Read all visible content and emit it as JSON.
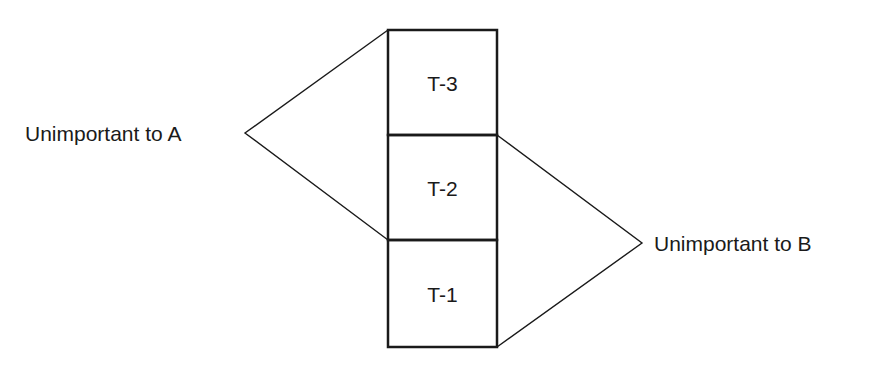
{
  "diagram": {
    "blocks": [
      {
        "id": "T-3",
        "label": "T-3"
      },
      {
        "id": "T-2",
        "label": "T-2"
      },
      {
        "id": "T-1",
        "label": "T-1"
      }
    ],
    "annotations": [
      {
        "label": "Unimportant to A",
        "spans": [
          "T-3",
          "T-2"
        ],
        "side": "left"
      },
      {
        "label": "Unimportant to B",
        "spans": [
          "T-2",
          "T-1"
        ],
        "side": "right"
      }
    ],
    "colors": {
      "line": "#1a1a1a",
      "background": "#ffffff"
    }
  }
}
